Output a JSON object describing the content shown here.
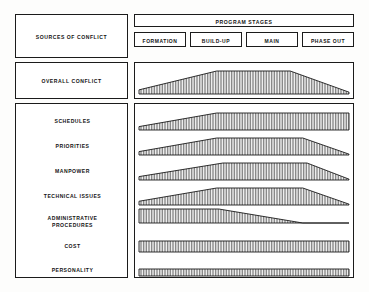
{
  "figure": {
    "left_column_header": "SOURCES OF CONFLICT",
    "overall_row_label": "OVERALL CONFLICT",
    "stages_header": "PROGRAM STAGES",
    "stages": [
      {
        "label": "FORMATION"
      },
      {
        "label": "BUILD-UP"
      },
      {
        "label": "MAIN"
      },
      {
        "label": "PHASE OUT"
      }
    ],
    "sources": [
      {
        "label": "SCHEDULES"
      },
      {
        "label": "PRIORITIES"
      },
      {
        "label": "MANPOWER"
      },
      {
        "label": "TECHNICAL ISSUES"
      },
      {
        "label_line1": "ADMINISTRATIVE",
        "label_line2": "PROCEDURES"
      },
      {
        "label": "COST"
      },
      {
        "label": "PERSONALITY"
      }
    ],
    "colors": {
      "ink": "#1b1b1b",
      "paper": "#ffffff",
      "hatch": "#6f6f6f"
    }
  },
  "chart_data": {
    "type": "area",
    "xlabel": "PROGRAM STAGES",
    "ylabel": "Relative Conflict Intensity",
    "x": [
      "FORMATION",
      "BUILD-UP",
      "MAIN",
      "PHASE OUT"
    ],
    "xlim": [
      0,
      1
    ],
    "ylim": [
      0,
      1
    ],
    "grid": false,
    "legend": false,
    "note": "Each band is a filled, vertically hatched profile whose height encodes relative conflict intensity across the four program stages.",
    "series": [
      {
        "name": "OVERALL CONFLICT",
        "profile": [
          {
            "x": 0.0,
            "y": 0.18
          },
          {
            "x": 0.37,
            "y": 1.0
          },
          {
            "x": 0.72,
            "y": 1.0
          },
          {
            "x": 1.0,
            "y": 0.08
          }
        ]
      },
      {
        "name": "SCHEDULES",
        "profile": [
          {
            "x": 0.0,
            "y": 0.2
          },
          {
            "x": 0.37,
            "y": 1.0
          },
          {
            "x": 1.0,
            "y": 1.0
          }
        ]
      },
      {
        "name": "PRIORITIES",
        "profile": [
          {
            "x": 0.0,
            "y": 0.2
          },
          {
            "x": 0.37,
            "y": 1.0
          },
          {
            "x": 0.78,
            "y": 1.0
          },
          {
            "x": 1.0,
            "y": 0.05
          }
        ]
      },
      {
        "name": "MANPOWER",
        "profile": [
          {
            "x": 0.0,
            "y": 0.2
          },
          {
            "x": 0.4,
            "y": 1.0
          },
          {
            "x": 0.8,
            "y": 1.0
          },
          {
            "x": 1.0,
            "y": 0.05
          }
        ]
      },
      {
        "name": "TECHNICAL ISSUES",
        "profile": [
          {
            "x": 0.0,
            "y": 0.22
          },
          {
            "x": 0.37,
            "y": 1.0
          },
          {
            "x": 0.78,
            "y": 1.0
          },
          {
            "x": 1.0,
            "y": 0.05
          }
        ]
      },
      {
        "name": "ADMINISTRATIVE PROCEDURES",
        "profile": [
          {
            "x": 0.0,
            "y": 1.0
          },
          {
            "x": 0.38,
            "y": 1.0
          },
          {
            "x": 0.78,
            "y": 0.0
          },
          {
            "x": 1.0,
            "y": 0.0
          }
        ]
      },
      {
        "name": "COST",
        "profile": [
          {
            "x": 0.0,
            "y": 1.0
          },
          {
            "x": 1.0,
            "y": 1.0
          }
        ]
      },
      {
        "name": "PERSONALITY",
        "profile": [
          {
            "x": 0.0,
            "y": 1.0
          },
          {
            "x": 1.0,
            "y": 1.0
          }
        ]
      }
    ]
  }
}
